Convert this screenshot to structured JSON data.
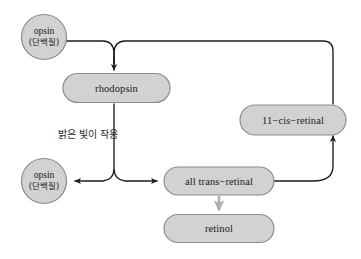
{
  "diagram": {
    "background_color": "#ffffff",
    "node_fill": "#d2d2d2",
    "node_stroke": "#8c8c8c",
    "edge_color": "#1c1c1c",
    "gray_arrow_color": "#b0b0b0",
    "nodes": [
      {
        "id": "opsin-top",
        "shape": "circle",
        "line1": "opsin",
        "line2": "(단백질)"
      },
      {
        "id": "rhodopsin",
        "shape": "pill",
        "label": "rhodopsin"
      },
      {
        "id": "eleven-cis-retinal",
        "shape": "pill",
        "label": "11−cis−retinal"
      },
      {
        "id": "opsin-bottom",
        "shape": "circle",
        "line1": "opsin",
        "line2": "(단백질)"
      },
      {
        "id": "all-trans-retinal",
        "shape": "pill",
        "label": "all trans−retinal"
      },
      {
        "id": "retinol",
        "shape": "pill",
        "label": "retinol"
      }
    ],
    "edge_labels": [
      {
        "id": "bright-light",
        "text": "밝은 빛이 작용"
      }
    ]
  }
}
